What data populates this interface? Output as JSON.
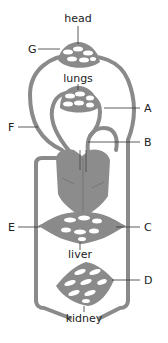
{
  "diagram": {
    "organs": {
      "head": "head",
      "lungs": "lungs",
      "liver": "liver",
      "kidney": "kidney"
    },
    "labels": {
      "A": "A",
      "B": "B",
      "C": "C",
      "D": "D",
      "E": "E",
      "F": "F",
      "G": "G"
    },
    "colors": {
      "vessel": "#8a8a8a",
      "heart": "#8c8c8c",
      "text": "#222222",
      "background": "#ffffff"
    }
  }
}
